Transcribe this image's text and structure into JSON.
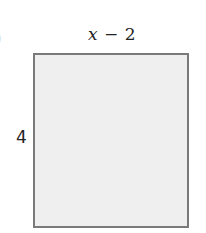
{
  "diagram": {
    "type": "rectangle",
    "part_label": ")",
    "width_label": {
      "variable": "x",
      "operator": "−",
      "constant": "2"
    },
    "height_label": "4",
    "colors": {
      "fill": "#efefef",
      "stroke": "#7a7a7a",
      "text": "#222222"
    }
  }
}
